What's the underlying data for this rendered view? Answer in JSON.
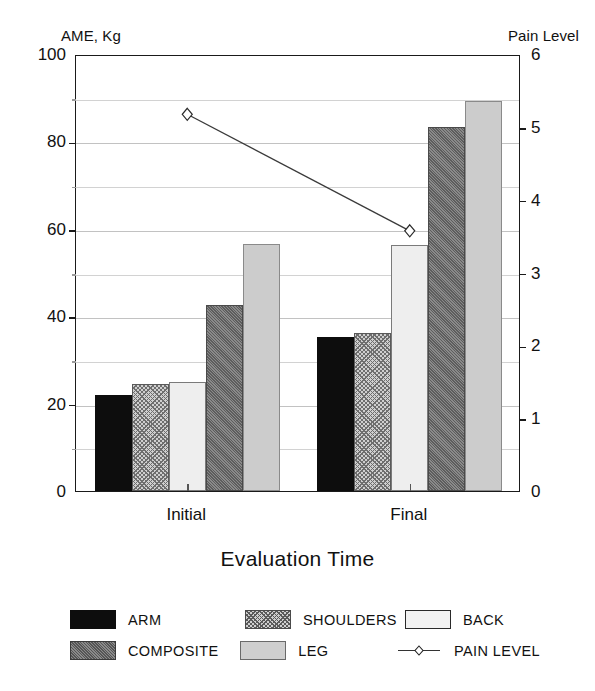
{
  "chart_data": {
    "type": "bar",
    "title": "",
    "xlabel": "Evaluation Time",
    "categories": [
      "Initial",
      "Final"
    ],
    "left_axis": {
      "label": "AME, Kg",
      "ylim": [
        0,
        100
      ],
      "ticks": [
        0,
        20,
        40,
        60,
        80,
        100
      ],
      "tick_labels": [
        "0",
        "20",
        "40",
        "60",
        "80",
        "100"
      ],
      "minor_ticks": [
        10,
        30,
        50,
        70,
        90
      ]
    },
    "right_axis": {
      "label": "Pain Level",
      "ylim": [
        0,
        6
      ],
      "ticks": [
        0,
        1,
        2,
        3,
        4,
        5,
        6
      ],
      "tick_labels": [
        "0",
        "1",
        "2",
        "3",
        "4",
        "5",
        "6"
      ]
    },
    "grid": true,
    "legend_position": "bottom",
    "series": [
      {
        "name": "ARM",
        "key": "arm",
        "axis": "left",
        "kind": "bar",
        "values": [
          22,
          35.2
        ]
      },
      {
        "name": "SHOULDERS",
        "key": "shoulders",
        "axis": "left",
        "kind": "bar",
        "values": [
          24.6,
          36.2
        ]
      },
      {
        "name": "BACK",
        "key": "back",
        "axis": "left",
        "kind": "bar",
        "values": [
          25,
          56.2
        ]
      },
      {
        "name": "COMPOSITE",
        "key": "composite",
        "axis": "left",
        "kind": "bar",
        "values": [
          42.6,
          83.2
        ]
      },
      {
        "name": "LEG",
        "key": "leg",
        "axis": "left",
        "kind": "bar",
        "values": [
          56.6,
          89.2
        ]
      },
      {
        "name": "PAIN LEVEL",
        "key": "painlevel",
        "axis": "right",
        "kind": "line",
        "values": [
          5.2,
          3.6
        ]
      }
    ],
    "legend_entries": [
      {
        "label": "ARM",
        "swatch": "arm"
      },
      {
        "label": "SHOULDERS",
        "swatch": "shoulders"
      },
      {
        "label": "BACK",
        "swatch": "back"
      },
      {
        "label": "COMPOSITE",
        "swatch": "composite"
      },
      {
        "label": "LEG",
        "swatch": "leg"
      },
      {
        "label": "PAIN LEVEL",
        "swatch": "line"
      }
    ]
  }
}
